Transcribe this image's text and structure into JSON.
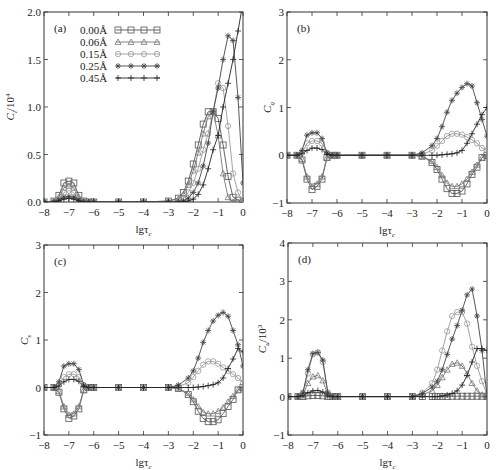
{
  "figure": {
    "panel_count": 4,
    "x_axis_label": "lgτ",
    "x_axis_subscript": "c",
    "series_styles": [
      {
        "name": "0.00Å",
        "marker": "square",
        "color": "#555555"
      },
      {
        "name": "0.06Å",
        "marker": "triangle",
        "color": "#777777"
      },
      {
        "name": "0.15Å",
        "marker": "circle",
        "color": "#999999"
      },
      {
        "name": "0.25Å",
        "marker": "star",
        "color": "#444444"
      },
      {
        "name": "0.45Å",
        "marker": "plus",
        "color": "#222222"
      }
    ]
  },
  "chart_data": [
    {
      "id": "a",
      "type": "line",
      "panel_label": "(a)",
      "ylabel": "C_l/10^4",
      "ylabel_main": "C",
      "ylabel_sub": "l",
      "ylabel_suffix": "/10",
      "ylabel_sup": "4",
      "xlabel": "lgτc",
      "xlim": [
        -8,
        0
      ],
      "ylim": [
        0,
        2.0
      ],
      "xticks": [
        -8,
        -7,
        -6,
        -5,
        -4,
        -3,
        -2,
        -1,
        0
      ],
      "xtick_labels": [
        "−8",
        "−7",
        "−6",
        "−5",
        "−4",
        "−3",
        "−2",
        "−1",
        "0"
      ],
      "yticks": [
        0,
        0.5,
        1.0,
        1.5,
        2.0
      ],
      "ytick_labels": [
        "0.0",
        "0.5",
        "1.0",
        "1.5",
        "2.0"
      ],
      "grid": false,
      "legend": {
        "position": "upper-center",
        "entries": [
          "0.00Å",
          "0.06Å",
          "0.15Å",
          "0.25Å",
          "0.45Å"
        ]
      },
      "box": {
        "left": 44,
        "top": 12,
        "right": 243,
        "bottom": 202
      },
      "x": [
        -8,
        -7.6,
        -7.4,
        -7.2,
        -7.0,
        -6.8,
        -6.6,
        -6.4,
        -6.2,
        -6,
        -5,
        -4,
        -3,
        -2.6,
        -2.4,
        -2.2,
        -2.0,
        -1.8,
        -1.6,
        -1.4,
        -1.2,
        -1.0,
        -0.8,
        -0.6,
        -0.4,
        -0.2,
        0
      ],
      "series": [
        {
          "name": "0.00Å",
          "values": [
            0,
            0.01,
            0.07,
            0.2,
            0.22,
            0.2,
            0.07,
            0.01,
            0,
            0,
            0,
            0,
            0.01,
            0.04,
            0.1,
            0.22,
            0.4,
            0.6,
            0.82,
            0.95,
            0.95,
            0.88,
            0.6,
            0.27,
            0.05,
            0.02,
            0.0
          ]
        },
        {
          "name": "0.06Å",
          "values": [
            0,
            0.01,
            0.05,
            0.15,
            0.17,
            0.15,
            0.05,
            0.01,
            0,
            0,
            0,
            0,
            0.01,
            0.03,
            0.08,
            0.18,
            0.33,
            0.52,
            0.72,
            0.9,
            0.95,
            0.7,
            0.3,
            0.05,
            0.0,
            0.0,
            0.0
          ]
        },
        {
          "name": "0.15Å",
          "values": [
            0,
            0.01,
            0.03,
            0.1,
            0.12,
            0.1,
            0.03,
            0.01,
            0,
            0,
            0,
            0,
            0.0,
            0.01,
            0.04,
            0.1,
            0.2,
            0.35,
            0.55,
            0.72,
            0.95,
            1.25,
            1.2,
            0.8,
            0.3,
            0.1,
            0.0
          ]
        },
        {
          "name": "0.25Å",
          "values": [
            0,
            0.0,
            0.02,
            0.05,
            0.06,
            0.05,
            0.02,
            0.0,
            0,
            0,
            0,
            0,
            0.0,
            0.0,
            0.01,
            0.04,
            0.1,
            0.2,
            0.38,
            0.62,
            0.95,
            1.2,
            1.5,
            1.75,
            1.7,
            1.1,
            0.2
          ]
        },
        {
          "name": "0.45Å",
          "values": [
            0,
            0.0,
            0.01,
            0.03,
            0.04,
            0.03,
            0.01,
            0.0,
            0,
            0,
            0,
            0,
            0.0,
            0.0,
            0.0,
            0.01,
            0.03,
            0.08,
            0.18,
            0.35,
            0.55,
            0.7,
            1.0,
            1.25,
            1.5,
            1.8,
            2.1
          ]
        }
      ]
    },
    {
      "id": "b",
      "type": "line",
      "panel_label": "(b)",
      "ylabel": "C_q",
      "ylabel_main": "C",
      "ylabel_sub": "q",
      "ylabel_suffix": "",
      "ylabel_sup": "",
      "xlabel": "lgτc",
      "xlim": [
        -8,
        0
      ],
      "ylim": [
        -1,
        3
      ],
      "xticks": [
        -8,
        -7,
        -6,
        -5,
        -4,
        -3,
        -2,
        -1,
        0
      ],
      "xtick_labels": [
        "−8",
        "−7",
        "−6",
        "−5",
        "−4",
        "−3",
        "−2",
        "−1",
        "0"
      ],
      "yticks": [
        -1,
        0,
        1,
        2,
        3
      ],
      "ytick_labels": [
        "−1",
        "0",
        "1",
        "2",
        "3"
      ],
      "grid": false,
      "box": {
        "left": 287,
        "top": 12,
        "right": 487,
        "bottom": 203
      },
      "x": [
        -8,
        -7.6,
        -7.4,
        -7.2,
        -7.0,
        -6.8,
        -6.6,
        -6.4,
        -6.2,
        -6,
        -5,
        -4,
        -3,
        -2.6,
        -2.2,
        -2.0,
        -1.8,
        -1.6,
        -1.4,
        -1.2,
        -1.0,
        -0.8,
        -0.6,
        -0.4,
        -0.2,
        0
      ],
      "series": [
        {
          "name": "0.00Å",
          "values": [
            0,
            0,
            -0.1,
            -0.5,
            -0.72,
            -0.65,
            -0.5,
            -0.05,
            0,
            0,
            0,
            0,
            0,
            -0.02,
            -0.15,
            -0.3,
            -0.5,
            -0.7,
            -0.8,
            -0.8,
            -0.75,
            -0.6,
            -0.4,
            -0.25,
            -0.05,
            0.0
          ]
        },
        {
          "name": "0.06Å",
          "values": [
            0,
            0,
            -0.08,
            -0.45,
            -0.65,
            -0.6,
            -0.45,
            -0.05,
            0,
            0,
            0,
            0,
            0,
            -0.02,
            -0.12,
            -0.25,
            -0.42,
            -0.58,
            -0.65,
            -0.65,
            -0.6,
            -0.5,
            -0.35,
            -0.2,
            -0.05,
            0.0
          ]
        },
        {
          "name": "0.15Å",
          "values": [
            0,
            0,
            0.05,
            0.25,
            0.3,
            0.3,
            0.25,
            0.05,
            0,
            0,
            0,
            0,
            0,
            0.02,
            0.1,
            0.2,
            0.3,
            0.4,
            0.45,
            0.45,
            0.43,
            0.38,
            0.32,
            0.25,
            0.15,
            0.1
          ]
        },
        {
          "name": "0.25Å",
          "values": [
            0,
            0,
            0.1,
            0.42,
            0.47,
            0.47,
            0.35,
            0.05,
            0,
            0,
            0,
            0,
            0,
            0.05,
            0.2,
            0.35,
            0.6,
            0.9,
            1.15,
            1.3,
            1.42,
            1.5,
            1.45,
            1.1,
            0.75,
            0.4
          ]
        },
        {
          "name": "0.45Å",
          "values": [
            0,
            0,
            0.03,
            0.1,
            0.15,
            0.15,
            0.12,
            0.02,
            0,
            0,
            0,
            0,
            0,
            0.0,
            0.0,
            0.0,
            0.01,
            0.02,
            0.03,
            0.05,
            0.1,
            0.25,
            0.45,
            0.65,
            0.85,
            1.0
          ]
        }
      ]
    },
    {
      "id": "c",
      "type": "line",
      "panel_label": "(c)",
      "ylabel": "C_s",
      "ylabel_main": "C",
      "ylabel_sub": "s",
      "ylabel_suffix": "",
      "ylabel_sup": "",
      "xlabel": "lgτc",
      "xlim": [
        -8,
        0
      ],
      "ylim": [
        -1,
        3
      ],
      "xticks": [
        -8,
        -7,
        -6,
        -5,
        -4,
        -3,
        -2,
        -1,
        0
      ],
      "xtick_labels": [
        "−8",
        "−7",
        "−6",
        "−5",
        "−4",
        "−3",
        "−2",
        "−1",
        "0"
      ],
      "yticks": [
        -1,
        0,
        1,
        2,
        3
      ],
      "ytick_labels": [
        "−1",
        "0",
        "1",
        "2",
        "3"
      ],
      "grid": false,
      "box": {
        "left": 44,
        "top": 245,
        "right": 243,
        "bottom": 435
      },
      "x": [
        -8,
        -7.6,
        -7.4,
        -7.2,
        -7.0,
        -6.8,
        -6.6,
        -6.4,
        -6.2,
        -6,
        -5,
        -4,
        -3,
        -2.6,
        -2.2,
        -2.0,
        -1.8,
        -1.6,
        -1.4,
        -1.2,
        -1.0,
        -0.8,
        -0.6,
        -0.4,
        -0.2,
        0
      ],
      "series": [
        {
          "name": "0.00Å",
          "values": [
            0,
            0,
            -0.1,
            -0.45,
            -0.65,
            -0.6,
            -0.45,
            -0.05,
            0,
            0,
            0,
            0,
            0,
            -0.02,
            -0.15,
            -0.3,
            -0.5,
            -0.65,
            -0.72,
            -0.72,
            -0.68,
            -0.55,
            -0.4,
            -0.25,
            -0.05,
            0.0
          ]
        },
        {
          "name": "0.06Å",
          "values": [
            0,
            0,
            -0.08,
            -0.4,
            -0.58,
            -0.55,
            -0.4,
            -0.05,
            0,
            0,
            0,
            0,
            0,
            -0.02,
            -0.12,
            -0.25,
            -0.4,
            -0.52,
            -0.55,
            -0.55,
            -0.5,
            -0.42,
            -0.3,
            -0.18,
            -0.05,
            0.0
          ]
        },
        {
          "name": "0.15Å",
          "values": [
            0,
            0,
            0.05,
            0.22,
            0.28,
            0.28,
            0.22,
            0.05,
            0,
            0,
            0,
            0,
            0,
            0.02,
            0.1,
            0.22,
            0.35,
            0.48,
            0.55,
            0.55,
            0.5,
            0.42,
            0.35,
            0.28,
            0.2,
            0.1
          ]
        },
        {
          "name": "0.25Å",
          "values": [
            0,
            0,
            0.12,
            0.45,
            0.5,
            0.5,
            0.38,
            0.05,
            0,
            0,
            0,
            0,
            0,
            0.05,
            0.2,
            0.35,
            0.62,
            0.95,
            1.2,
            1.4,
            1.52,
            1.58,
            1.5,
            1.2,
            0.9,
            0.45
          ]
        },
        {
          "name": "0.45Å",
          "values": [
            0,
            0,
            0.03,
            0.12,
            0.17,
            0.17,
            0.13,
            0.02,
            0,
            0,
            0,
            0,
            0,
            0.0,
            0.0,
            0.0,
            0.01,
            0.02,
            0.04,
            0.06,
            0.1,
            0.2,
            0.4,
            0.6,
            0.82,
            0.75
          ]
        }
      ]
    },
    {
      "id": "d",
      "type": "line",
      "panel_label": "(d)",
      "ylabel": "C_u/10^3",
      "ylabel_main": "C",
      "ylabel_sub": "u",
      "ylabel_suffix": "/10",
      "ylabel_sup": "3",
      "xlabel": "lgτc",
      "xlim": [
        -8,
        0
      ],
      "ylim": [
        -1,
        4
      ],
      "xticks": [
        -8,
        -7,
        -6,
        -5,
        -4,
        -3,
        -2,
        -1,
        0
      ],
      "xtick_labels": [
        "−8",
        "−7",
        "−6",
        "−5",
        "−4",
        "−3",
        "−2",
        "−1",
        "0"
      ],
      "yticks": [
        -1,
        0,
        1,
        2,
        3,
        4
      ],
      "ytick_labels": [
        "−1",
        "0",
        "1",
        "2",
        "3",
        "4"
      ],
      "grid": false,
      "box": {
        "left": 288,
        "top": 243,
        "right": 487,
        "bottom": 435
      },
      "x": [
        -8,
        -7.6,
        -7.4,
        -7.2,
        -7.0,
        -6.8,
        -6.6,
        -6.4,
        -6.2,
        -6,
        -5,
        -4,
        -3,
        -2.6,
        -2.2,
        -2.0,
        -1.8,
        -1.6,
        -1.4,
        -1.2,
        -1.0,
        -0.8,
        -0.6,
        -0.4,
        -0.2,
        0
      ],
      "series": [
        {
          "name": "0.00Å",
          "values": [
            0,
            0,
            0,
            0.02,
            0.03,
            0.03,
            0.02,
            0,
            0,
            0,
            0,
            0,
            0,
            0,
            0,
            0.0,
            0.0,
            0.0,
            0.01,
            0.01,
            0.01,
            0.01,
            0.01,
            0.01,
            0.01,
            0.0
          ]
        },
        {
          "name": "0.06Å",
          "values": [
            0,
            0,
            0.05,
            0.35,
            0.52,
            0.55,
            0.42,
            0.05,
            0,
            0,
            0,
            0,
            0,
            0.05,
            0.15,
            0.3,
            0.5,
            0.7,
            0.85,
            0.88,
            0.8,
            0.6,
            0.35,
            0.15,
            0.05,
            0.0
          ]
        },
        {
          "name": "0.15Å",
          "values": [
            0,
            0,
            0.1,
            0.6,
            1.1,
            1.15,
            0.9,
            0.1,
            0,
            0,
            0,
            0,
            0,
            0.1,
            0.35,
            0.7,
            1.2,
            1.7,
            2.1,
            2.2,
            2.2,
            1.9,
            1.3,
            0.8,
            0.4,
            0.05
          ]
        },
        {
          "name": "0.25Å",
          "values": [
            0,
            0,
            0.1,
            0.7,
            1.12,
            1.15,
            0.95,
            0.1,
            0,
            0,
            0,
            0,
            0,
            0.08,
            0.25,
            0.4,
            0.7,
            1.1,
            1.5,
            1.85,
            2.25,
            2.65,
            2.8,
            2.1,
            1.2,
            0.0
          ]
        },
        {
          "name": "0.45Å",
          "values": [
            0,
            0,
            0.02,
            0.1,
            0.15,
            0.16,
            0.12,
            0.02,
            0,
            0,
            0,
            0,
            0,
            0.0,
            0.0,
            0.0,
            0.02,
            0.04,
            0.08,
            0.15,
            0.3,
            0.55,
            0.9,
            1.25,
            1.25,
            1.2
          ]
        }
      ]
    }
  ]
}
